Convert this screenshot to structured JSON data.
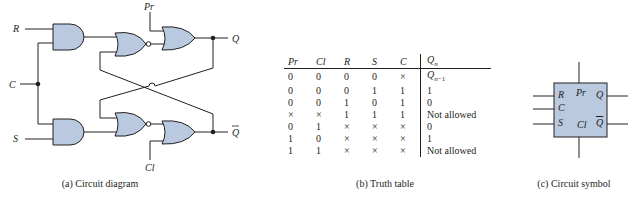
{
  "circuit_diagram": {
    "caption": "(a) Circuit diagram",
    "inputs": {
      "R": "R",
      "C": "C",
      "S": "S",
      "Pr": "Pr",
      "Cl": "Cl"
    },
    "outputs": {
      "Q": "Q",
      "Qbar": "Q̄"
    },
    "gates": [
      "AND (upper)",
      "AND (lower)",
      "NOR (upper)",
      "NOR (lower)",
      "OR (upper, Pr)",
      "OR (lower, Cl)"
    ],
    "gate_fill": "#b9c9df",
    "stroke": "#231f20"
  },
  "truth_table": {
    "caption": "(b) Truth table",
    "headers": [
      "Pr",
      "Cl",
      "R",
      "S",
      "C",
      "Qn"
    ],
    "rows": [
      [
        "0",
        "0",
        "0",
        "0",
        "×",
        "Qn−1"
      ],
      [
        "0",
        "0",
        "0",
        "1",
        "1",
        "1"
      ],
      [
        "0",
        "0",
        "1",
        "0",
        "1",
        "0"
      ],
      [
        "×",
        "×",
        "1",
        "1",
        "1",
        "Not allowed"
      ],
      [
        "0",
        "1",
        "×",
        "×",
        "×",
        "0"
      ],
      [
        "1",
        "0",
        "×",
        "×",
        "×",
        "1"
      ],
      [
        "1",
        "1",
        "×",
        "×",
        "×",
        "Not allowed"
      ]
    ]
  },
  "circuit_symbol": {
    "caption": "(c) Circuit symbol",
    "labels": {
      "R": "R",
      "C": "C",
      "S": "S",
      "Pr": "Pr",
      "Q": "Q",
      "Cl": "Cl",
      "Qbar": "Q"
    },
    "box_fill": "#b9c9df"
  }
}
